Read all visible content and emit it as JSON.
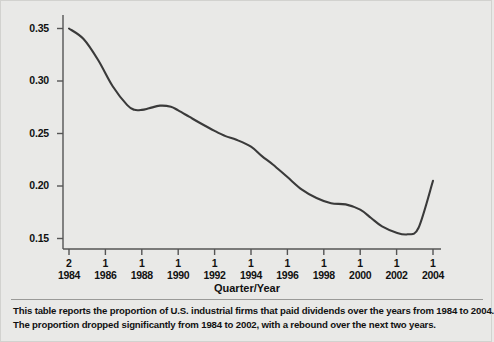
{
  "chart_data": {
    "type": "line",
    "title": "",
    "xlabel": "Quarter/Year",
    "ylabel": "",
    "ylim": [
      0.133,
      0.362
    ],
    "xlim": [
      0,
      10
    ],
    "grid": false,
    "legend": null,
    "y_ticks": [
      "0.35",
      "0.30",
      "0.25",
      "0.20",
      "0.15"
    ],
    "y_tick_values": [
      0.35,
      0.3,
      0.25,
      0.2,
      0.15
    ],
    "x_ticks": [
      {
        "quarter": "2",
        "year": "1984"
      },
      {
        "quarter": "1",
        "year": "1986"
      },
      {
        "quarter": "1",
        "year": "1988"
      },
      {
        "quarter": "1",
        "year": "1990"
      },
      {
        "quarter": "1",
        "year": "1992"
      },
      {
        "quarter": "1",
        "year": "1994"
      },
      {
        "quarter": "1",
        "year": "1996"
      },
      {
        "quarter": "1",
        "year": "1998"
      },
      {
        "quarter": "1",
        "year": "2000"
      },
      {
        "quarter": "1",
        "year": "2002"
      },
      {
        "quarter": "1",
        "year": "2004"
      }
    ],
    "series": [
      {
        "name": "Proportion of U.S. industrial firms paying dividends",
        "x": [
          0.0,
          0.4,
          0.8,
          1.2,
          1.6,
          1.8,
          2.0,
          2.2,
          2.5,
          2.8,
          3.0,
          3.3,
          3.6,
          4.0,
          4.3,
          4.6,
          5.0,
          5.3,
          5.6,
          6.0,
          6.4,
          6.8,
          7.2,
          7.6,
          8.0,
          8.3,
          8.6,
          9.0,
          9.3,
          9.6,
          10.0
        ],
        "values": [
          0.35,
          0.34,
          0.32,
          0.295,
          0.277,
          0.2725,
          0.2725,
          0.274,
          0.2765,
          0.2755,
          0.272,
          0.266,
          0.26,
          0.2525,
          0.2475,
          0.244,
          0.2375,
          0.2285,
          0.2205,
          0.2085,
          0.1965,
          0.1885,
          0.1835,
          0.1825,
          0.1775,
          0.1695,
          0.1615,
          0.1555,
          0.154,
          0.16,
          0.205
        ]
      }
    ],
    "line_color": "#3a3a3a",
    "axis_color": "#555555",
    "background_color": "#e9e9e7"
  },
  "axis": {
    "x_title": "Quarter/Year"
  },
  "caption": {
    "line1": "This table reports the proportion of U.S. industrial firms that paid dividends over the years from 1984 to 2004.",
    "line2": "The proportion dropped significantly from 1984 to 2002, with a rebound over the next two years."
  }
}
